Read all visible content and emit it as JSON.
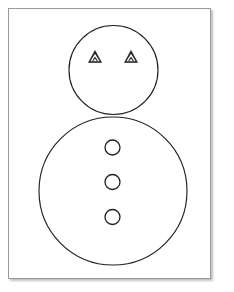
{
  "page": {
    "width": 234,
    "height": 292,
    "background_color": "#ffffff"
  },
  "card": {
    "name": "figure-card",
    "x": 8,
    "y": 8,
    "width": 203,
    "height": 271,
    "fill_color": "#ffffff",
    "border_color": "#9a9a9a",
    "shadow": true
  },
  "drawing": {
    "title": "",
    "line_color": "#231f20",
    "fill_color": "none",
    "description": "Line drawing of a snowman-like figure: a small head circle above a large body circle, two triangular eyes, three round buttons"
  },
  "chart_data": {
    "type": "diagram",
    "title": "",
    "xlabel": "",
    "ylabel": "",
    "coordinate_space": {
      "width": 203,
      "height": 271,
      "origin": "top-left of card interior"
    },
    "shapes": [
      {
        "name": "head-circle",
        "shape": "circle",
        "cx": 104.5,
        "cy": 61,
        "r": 44.5,
        "stroke": "#231f20",
        "fill": "none"
      },
      {
        "name": "body-circle",
        "shape": "circle",
        "cx": 104,
        "cy": 182,
        "r": 74,
        "stroke": "#231f20",
        "fill": "none"
      },
      {
        "name": "eye-left",
        "shape": "triangle",
        "cx": 86,
        "cy": 48,
        "size": 11,
        "stroke": "#231f20",
        "fill": "#231f20"
      },
      {
        "name": "eye-right",
        "shape": "triangle",
        "cx": 122,
        "cy": 48,
        "size": 11,
        "stroke": "#231f20",
        "fill": "#231f20"
      },
      {
        "name": "button-top",
        "shape": "circle",
        "cx": 103.5,
        "cy": 138.5,
        "r": 7.5,
        "stroke": "#231f20",
        "fill": "none"
      },
      {
        "name": "button-middle",
        "shape": "circle",
        "cx": 103.5,
        "cy": 173,
        "r": 7.5,
        "stroke": "#231f20",
        "fill": "none"
      },
      {
        "name": "button-bottom",
        "shape": "circle",
        "cx": 103.5,
        "cy": 208,
        "r": 7.5,
        "stroke": "#231f20",
        "fill": "none"
      }
    ],
    "counts": {
      "circles": 5,
      "triangles": 2,
      "buttons": 3,
      "eyes": 2
    },
    "grid": false,
    "legend": null,
    "annotations": []
  }
}
